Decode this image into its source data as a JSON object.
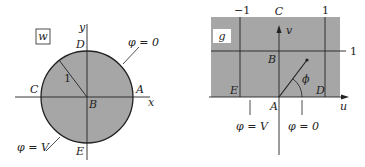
{
  "colors": {
    "fill": "#a6a6a6",
    "line": "#222222",
    "background": "#ffffff",
    "box_fill": "#ffffff"
  },
  "left_panel": {
    "plane_label": "w",
    "axis_x": "x",
    "axis_y": "y",
    "points": {
      "A": "A",
      "B": "B",
      "C": "C",
      "D": "D",
      "E": "E"
    },
    "radius_label": "1",
    "boundary_labels": {
      "upper": "φ = 0",
      "lower": "φ = V"
    }
  },
  "right_panel": {
    "plane_label": "g",
    "axis_u": "u",
    "axis_v": "v",
    "tick_labels": {
      "neg_one": "−1",
      "pos_one": "1",
      "v_one": "1"
    },
    "points": {
      "A": "A",
      "B": "B",
      "C": "C",
      "D": "D",
      "E": "E"
    },
    "angle_label": "ϕ",
    "boundary_labels": {
      "left": "φ = V",
      "right": "φ = 0"
    }
  }
}
